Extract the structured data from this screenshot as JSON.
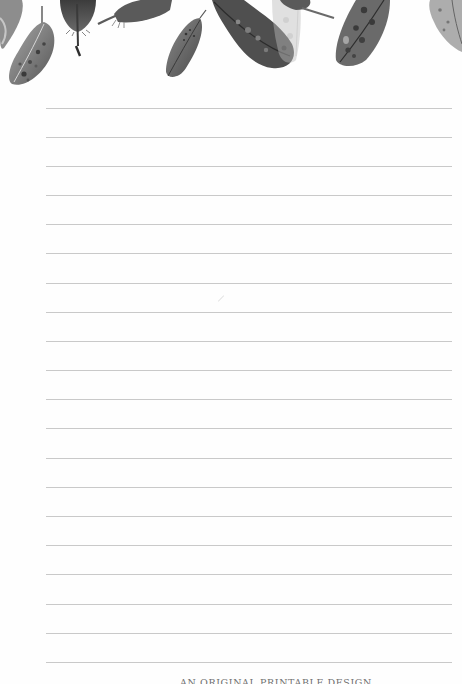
{
  "document": {
    "type": "lined-notepad-page",
    "background_color": "#fefefe",
    "rule_color": "#c9c9c9",
    "rule_count": 20,
    "rule_positions_y": [
      108,
      137,
      166,
      195,
      224,
      253,
      283,
      312,
      341,
      370,
      399,
      428,
      458,
      487,
      516,
      545,
      574,
      604,
      633,
      662
    ],
    "rule_x_start": 46,
    "rule_x_end": 452
  },
  "header": {
    "decoration": "watercolor-feathers",
    "palette": [
      "#3a3a3a",
      "#5a5a5a",
      "#7d7d7d",
      "#a5a5a5",
      "#cfcfcf"
    ]
  },
  "footer": {
    "text": "AN ORIGINAL PRINTABLE DESIGN"
  }
}
